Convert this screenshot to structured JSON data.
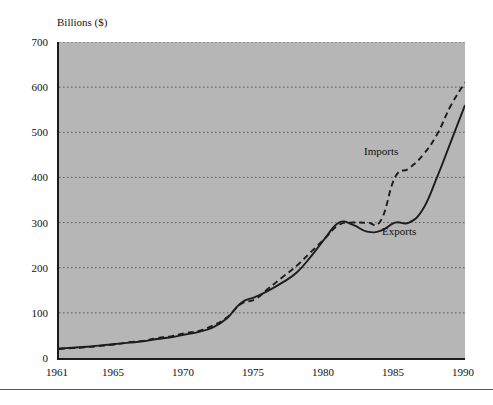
{
  "figure": {
    "caption_sliver": "",
    "axis_title": "Billions ($)"
  },
  "chart_data": {
    "type": "line",
    "title": "",
    "subtitle": "",
    "xlabel": "",
    "ylabel": "Billions ($)",
    "axis_title_display": "Billions ($)",
    "xlim": [
      1961,
      1990
    ],
    "ylim": [
      0,
      700
    ],
    "ytick_values": [
      0,
      100,
      200,
      300,
      400,
      500,
      600,
      700
    ],
    "ytick_labels": [
      "0",
      "100",
      "200",
      "300",
      "400",
      "500",
      "600",
      "700"
    ],
    "xtick_values": [
      1961,
      1965,
      1970,
      1975,
      1980,
      1985,
      1990
    ],
    "xtick_labels": [
      "1961",
      "1965",
      "1970",
      "1975",
      "1980",
      "1985",
      "1990"
    ],
    "grid": "horizontal-dotted",
    "legend": "inline-annotations",
    "plot_background": "#b6b6b6",
    "line_color": "#1c1c1c",
    "x": [
      1961,
      1962,
      1963,
      1964,
      1965,
      1966,
      1967,
      1968,
      1969,
      1970,
      1971,
      1972,
      1973,
      1974,
      1975,
      1976,
      1977,
      1978,
      1979,
      1980,
      1981,
      1982,
      1983,
      1984,
      1985,
      1986,
      1987,
      1988,
      1989,
      1990
    ],
    "series": [
      {
        "name": "Imports",
        "style": "dashed",
        "values": [
          20,
          22,
          24,
          27,
          30,
          35,
          38,
          44,
          48,
          55,
          60,
          72,
          90,
          120,
          130,
          155,
          180,
          205,
          235,
          265,
          295,
          300,
          300,
          305,
          400,
          420,
          450,
          495,
          560,
          610
        ]
      },
      {
        "name": "Exports",
        "style": "solid",
        "values": [
          21,
          23,
          25,
          28,
          31,
          34,
          37,
          42,
          46,
          52,
          58,
          68,
          88,
          122,
          135,
          150,
          168,
          190,
          225,
          265,
          300,
          295,
          280,
          282,
          300,
          300,
          330,
          400,
          480,
          560
        ]
      }
    ],
    "annotations": [
      {
        "text": "Imports",
        "x": 1986,
        "y": 440
      },
      {
        "text": "Exports",
        "x": 1987,
        "y": 260
      }
    ]
  },
  "labels": {
    "imports": "Imports",
    "exports": "Exports"
  }
}
